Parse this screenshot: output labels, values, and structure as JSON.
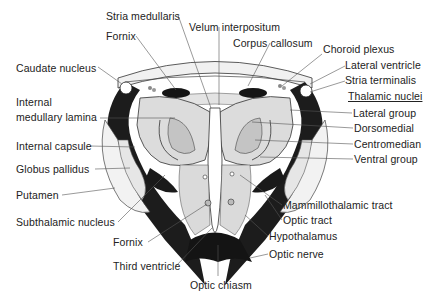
{
  "diagram": {
    "colors": {
      "background": "#ffffff",
      "dark_tract": "#1a1a1a",
      "grey_matter": "#d9d9d9",
      "light_fill": "#eeeeee",
      "text": "#222222",
      "leader_line": "#555555"
    },
    "labels_left": [
      {
        "id": "caudate-nucleus",
        "text": "Caudate nucleus",
        "x": 16,
        "y": 65
      },
      {
        "id": "internal-medullary-lamina-1",
        "text": "Internal",
        "x": 16,
        "y": 97
      },
      {
        "id": "internal-medullary-lamina-2",
        "text": "medullary lamina",
        "x": 16,
        "y": 112
      },
      {
        "id": "internal-capsule",
        "text": "Internal capsule",
        "x": 16,
        "y": 141
      },
      {
        "id": "globus-pallidus",
        "text": "Globus pallidus",
        "x": 16,
        "y": 163
      },
      {
        "id": "putamen",
        "text": "Putamen",
        "x": 16,
        "y": 189
      },
      {
        "id": "subthalamic-nucleus",
        "text": "Subthalamic nucleus",
        "x": 16,
        "y": 215
      },
      {
        "id": "fornix-lower",
        "text": "Fornix",
        "x": 113,
        "y": 239
      },
      {
        "id": "third-ventricle",
        "text": "Third ventricle",
        "x": 113,
        "y": 262
      }
    ],
    "labels_top": [
      {
        "id": "stria-medullaris",
        "text": "Stria medullaris",
        "x": 106,
        "y": 10
      },
      {
        "id": "fornix-upper",
        "text": "Fornix",
        "x": 106,
        "y": 30
      },
      {
        "id": "velum-interpositum",
        "text": "Velum interpositum",
        "x": 189,
        "y": 21
      },
      {
        "id": "corpus-callosum",
        "text": "Corpus callosum",
        "x": 233,
        "y": 37
      }
    ],
    "labels_right": [
      {
        "id": "choroid-plexus",
        "text": "Choroid plexus",
        "x": 323,
        "y": 44
      },
      {
        "id": "lateral-ventricle",
        "text": "Lateral ventricle",
        "x": 345,
        "y": 60
      },
      {
        "id": "stria-terminalis",
        "text": "Stria terminalis",
        "x": 345,
        "y": 75
      },
      {
        "id": "thalamic-nuclei",
        "text": "Thalamic nuclei",
        "x": 348,
        "y": 91,
        "underline": true
      },
      {
        "id": "lateral-group",
        "text": "Lateral group",
        "x": 353,
        "y": 107
      },
      {
        "id": "dorsomedial",
        "text": "Dorsomedial",
        "x": 354,
        "y": 122
      },
      {
        "id": "centromedian",
        "text": "Centromedian",
        "x": 354,
        "y": 138
      },
      {
        "id": "ventral-group",
        "text": "Ventral group",
        "x": 354,
        "y": 153
      },
      {
        "id": "mammillothalamic-tract",
        "text": "Mammillothalamic tract",
        "x": 283,
        "y": 200
      },
      {
        "id": "optic-tract",
        "text": "Optic tract",
        "x": 283,
        "y": 215
      },
      {
        "id": "hypothalamus",
        "text": "Hypothalamus",
        "x": 269,
        "y": 231
      },
      {
        "id": "optic-nerve",
        "text": "Optic nerve",
        "x": 269,
        "y": 249
      },
      {
        "id": "optic-chiasm",
        "text": "Optic chiasm",
        "x": 190,
        "y": 279
      }
    ]
  }
}
